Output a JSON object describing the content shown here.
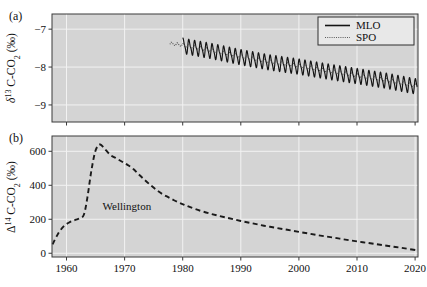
{
  "figure": {
    "width": 427,
    "height": 287,
    "background_color": "#ffffff",
    "plot_background_color": "#d4d4d4",
    "gridline_color": "#f2f2f2",
    "frame_color": "#3a3a3a"
  },
  "panels": {
    "a": {
      "label": "(a)",
      "ylabel_parts": {
        "delta": "δ",
        "sup": "13",
        "rest": " C-CO",
        "sub": "2",
        "units": " (‰)"
      },
      "ylabel_plain": "δ¹³ C-CO₂ (‰)",
      "yticks": [
        -7,
        -8,
        -9
      ],
      "ytick_labels": [
        "−7",
        "−8",
        "−9"
      ],
      "ylim": [
        -9.45,
        -6.6
      ],
      "xlim": [
        1957.5,
        2020.5
      ],
      "xticks": [
        1960,
        1970,
        1980,
        1990,
        2000,
        2010,
        2020
      ],
      "legend": {
        "position": "top-right",
        "entries": [
          {
            "label": "MLO",
            "style": "solid",
            "color": "#141414"
          },
          {
            "label": "SPO",
            "style": "dotted",
            "color": "#4a4a4a"
          }
        ]
      }
    },
    "b": {
      "label": "(b)",
      "ylabel_parts": {
        "delta": "Δ",
        "sup": "14",
        "rest": " C-CO",
        "sub": "2",
        "units": " (‰)"
      },
      "ylabel_plain": "Δ¹⁴ C-CO₂ (‰)",
      "yticks": [
        0,
        200,
        400,
        600
      ],
      "ytick_labels": [
        "0",
        "200",
        "400",
        "600"
      ],
      "ylim": [
        -22,
        690
      ],
      "xlim": [
        1957.5,
        2020.5
      ],
      "xticks": [
        1960,
        1970,
        1980,
        1990,
        2000,
        2010,
        2020
      ],
      "xtick_labels": [
        "1960",
        "1970",
        "1980",
        "1990",
        "2000",
        "2010",
        "2020"
      ],
      "annotations": [
        {
          "text": "Wellington",
          "x": 1966.2,
          "y": 252
        }
      ]
    }
  },
  "chart_data": [
    {
      "type": "line",
      "panel": "a",
      "title": "",
      "xlabel": "",
      "ylabel": "δ¹³ C-CO₂ (‰)",
      "xlim": [
        1957.5,
        2020.5
      ],
      "ylim": [
        -9.45,
        -6.6
      ],
      "xticks": [
        1960,
        1970,
        1980,
        1990,
        2000,
        2010,
        2020
      ],
      "yticks": [
        -7,
        -8,
        -9
      ],
      "grid": true,
      "legend": [
        "MLO",
        "SPO"
      ],
      "legend_position": "upper right",
      "series": [
        {
          "name": "MLO",
          "style": "solid",
          "color": "#141414",
          "description": "Mauna Loa delta-13C of CO2, monthly, strong seasonal cycle amplitude ~0.35 permil, declining trend",
          "x_start": 1980.0,
          "x_end": 2020.4,
          "seasonal_amplitude": 0.18,
          "trend_points": [
            {
              "x": 1980.0,
              "y": -7.44
            },
            {
              "x": 1985.0,
              "y": -7.58
            },
            {
              "x": 1990.0,
              "y": -7.74
            },
            {
              "x": 1995.0,
              "y": -7.88
            },
            {
              "x": 2000.0,
              "y": -7.99
            },
            {
              "x": 2005.0,
              "y": -8.12
            },
            {
              "x": 2010.0,
              "y": -8.24
            },
            {
              "x": 2015.0,
              "y": -8.36
            },
            {
              "x": 2020.4,
              "y": -8.52
            }
          ]
        },
        {
          "name": "SPO",
          "style": "dotted",
          "color": "#4a4a4a",
          "description": "South Pole delta-13C of CO2, smooth, small seasonal cycle, same declining trend",
          "x_start": 1977.8,
          "x_end": 2020.4,
          "seasonal_amplitude": 0.035,
          "trend_points": [
            {
              "x": 1977.8,
              "y": -7.38
            },
            {
              "x": 1980.0,
              "y": -7.42
            },
            {
              "x": 1985.0,
              "y": -7.56
            },
            {
              "x": 1990.0,
              "y": -7.72
            },
            {
              "x": 1995.0,
              "y": -7.86
            },
            {
              "x": 2000.0,
              "y": -7.97
            },
            {
              "x": 2005.0,
              "y": -8.1
            },
            {
              "x": 2010.0,
              "y": -8.22
            },
            {
              "x": 2015.0,
              "y": -8.34
            },
            {
              "x": 2020.4,
              "y": -8.5
            }
          ]
        }
      ]
    },
    {
      "type": "line",
      "panel": "b",
      "title": "",
      "xlabel": "",
      "ylabel": "Δ¹⁴ C-CO₂ (‰)",
      "xlim": [
        1957.5,
        2020.5
      ],
      "ylim": [
        -22,
        690
      ],
      "xticks": [
        1960,
        1970,
        1980,
        1990,
        2000,
        2010,
        2020
      ],
      "yticks": [
        0,
        200,
        400,
        600
      ],
      "grid": true,
      "annotations": [
        "Wellington"
      ],
      "series": [
        {
          "name": "Wellington",
          "style": "dashed",
          "color": "#1a1a1a",
          "description": "Wellington NZ Delta-14C of CO2: bomb spike peaking 1965 then exponential decay",
          "x": [
            1957.6,
            1958.5,
            1959.5,
            1960.5,
            1961.5,
            1962.3,
            1963.0,
            1963.6,
            1964.2,
            1964.8,
            1965.3,
            1965.8,
            1966.5,
            1967.5,
            1968.5,
            1969.5,
            1970.5,
            1971.5,
            1972.5,
            1973.5,
            1974.5,
            1975.5,
            1976.5,
            1977.5,
            1978.5,
            1979.5,
            1980.5,
            1982.0,
            1984.0,
            1986.0,
            1988.0,
            1990.0,
            1992.0,
            1994.0,
            1996.0,
            1998.0,
            2000.0,
            2002.0,
            2004.0,
            2006.0,
            2008.0,
            2010.0,
            2012.0,
            2014.0,
            2016.0,
            2018.0,
            2020.2
          ],
          "y": [
            52,
            112,
            158,
            182,
            196,
            206,
            228,
            330,
            470,
            580,
            628,
            640,
            618,
            580,
            560,
            540,
            520,
            496,
            462,
            430,
            400,
            372,
            348,
            330,
            312,
            296,
            282,
            262,
            240,
            222,
            206,
            190,
            176,
            162,
            150,
            138,
            126,
            114,
            102,
            92,
            80,
            70,
            60,
            50,
            40,
            30,
            18
          ]
        }
      ]
    }
  ]
}
